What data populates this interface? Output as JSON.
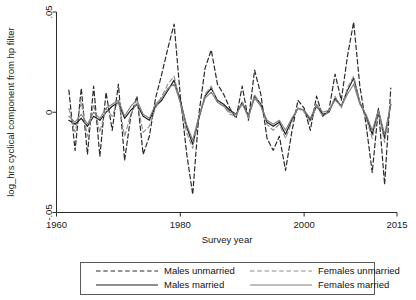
{
  "chart_data": {
    "type": "line",
    "title": "",
    "xlabel": "Survey year",
    "ylabel": "log_hrs cyclical component from hp filter",
    "xlim": [
      1960,
      2015
    ],
    "ylim": [
      -0.05,
      0.05
    ],
    "xticks": [
      1960,
      1980,
      2000,
      2015
    ],
    "xticklabels": [
      "1960",
      "1980",
      "2000",
      "2015"
    ],
    "yticks": [
      0.05,
      0,
      -0.05
    ],
    "yticklabels": [
      ".05",
      "0",
      "-.05"
    ],
    "grid": false,
    "legend_position": "below-center",
    "x": [
      1962,
      1963,
      1964,
      1965,
      1966,
      1967,
      1968,
      1969,
      1970,
      1971,
      1972,
      1973,
      1974,
      1975,
      1976,
      1977,
      1978,
      1979,
      1980,
      1981,
      1982,
      1983,
      1984,
      1985,
      1986,
      1987,
      1988,
      1989,
      1990,
      1991,
      1992,
      1993,
      1994,
      1995,
      1996,
      1997,
      1998,
      1999,
      2000,
      2001,
      2002,
      2003,
      2004,
      2005,
      2006,
      2007,
      2008,
      2009,
      2010,
      2011,
      2012,
      2013,
      2014
    ],
    "series": [
      {
        "name": "Males unmarried",
        "style": "dashed",
        "color": "#2a2a2a",
        "width": 1.2,
        "values": [
          0.011,
          -0.019,
          0.012,
          -0.021,
          0.013,
          -0.022,
          0.01,
          -0.009,
          0.014,
          -0.024,
          -0.002,
          0.008,
          -0.021,
          -0.012,
          0.007,
          0.019,
          0.032,
          0.044,
          0.008,
          -0.02,
          -0.041,
          -0.001,
          0.022,
          0.031,
          0.014,
          0.009,
          0.002,
          -0.003,
          0.013,
          -0.004,
          0.021,
          0.009,
          -0.013,
          -0.019,
          -0.012,
          -0.029,
          -0.01,
          0.006,
          0.002,
          -0.009,
          0.008,
          -0.002,
          0.001,
          0.019,
          0.006,
          0.028,
          0.045,
          0.013,
          -0.006,
          -0.03,
          0.002,
          -0.036,
          0.012
        ]
      },
      {
        "name": "Males married",
        "style": "solid",
        "color": "#1e1e1e",
        "width": 1.2,
        "values": [
          -0.004,
          -0.006,
          -0.003,
          -0.007,
          -0.002,
          -0.004,
          0.0,
          0.003,
          0.005,
          -0.003,
          0.001,
          0.004,
          -0.002,
          -0.004,
          0.003,
          0.006,
          0.011,
          0.016,
          0.006,
          -0.007,
          -0.016,
          -0.003,
          0.008,
          0.012,
          0.006,
          0.004,
          0.001,
          -0.001,
          0.005,
          -0.002,
          0.008,
          0.004,
          -0.005,
          -0.007,
          -0.005,
          -0.011,
          -0.004,
          0.002,
          0.001,
          -0.004,
          0.003,
          -0.001,
          0.0,
          0.007,
          0.003,
          0.011,
          0.017,
          0.005,
          -0.002,
          -0.011,
          0.001,
          -0.013,
          0.004
        ]
      },
      {
        "name": "Females unmarried",
        "style": "dashed",
        "color": "#8c8c8c",
        "width": 1.1,
        "values": [
          0.002,
          -0.01,
          0.005,
          -0.012,
          0.004,
          -0.01,
          0.002,
          -0.002,
          0.006,
          -0.012,
          -0.001,
          0.005,
          -0.01,
          -0.007,
          0.002,
          0.008,
          0.014,
          0.018,
          0.004,
          -0.01,
          -0.018,
          -0.002,
          0.009,
          0.013,
          0.005,
          0.003,
          -0.001,
          -0.002,
          0.005,
          -0.003,
          0.009,
          0.003,
          -0.006,
          -0.009,
          -0.006,
          -0.013,
          -0.005,
          0.002,
          0.0,
          -0.005,
          0.003,
          -0.002,
          0.0,
          0.008,
          0.002,
          0.012,
          0.018,
          0.005,
          -0.003,
          -0.013,
          0.0,
          -0.015,
          0.005
        ]
      },
      {
        "name": "Females married",
        "style": "solid",
        "color": "#7f7f7f",
        "width": 1.1,
        "values": [
          -0.002,
          -0.005,
          -0.001,
          -0.006,
          0.0,
          -0.003,
          0.002,
          0.004,
          0.006,
          -0.002,
          0.003,
          0.006,
          -0.001,
          -0.003,
          0.004,
          0.007,
          0.012,
          0.014,
          0.005,
          -0.006,
          -0.014,
          -0.002,
          0.007,
          0.01,
          0.005,
          0.003,
          0.0,
          -0.001,
          0.004,
          -0.002,
          0.007,
          0.003,
          -0.004,
          -0.006,
          -0.004,
          -0.009,
          -0.003,
          0.002,
          0.001,
          -0.003,
          0.004,
          0.0,
          0.001,
          0.006,
          0.003,
          0.009,
          0.014,
          0.004,
          -0.001,
          -0.009,
          0.001,
          -0.011,
          0.004
        ]
      }
    ]
  },
  "legend": {
    "entries": [
      {
        "label": "Males unmarried",
        "style": "dashed",
        "color": "#2a2a2a"
      },
      {
        "label": "Females unmarried",
        "style": "dashed",
        "color": "#8c8c8c"
      },
      {
        "label": "Males married",
        "style": "solid",
        "color": "#1e1e1e"
      },
      {
        "label": "Females married",
        "style": "solid",
        "color": "#7f7f7f"
      }
    ]
  }
}
